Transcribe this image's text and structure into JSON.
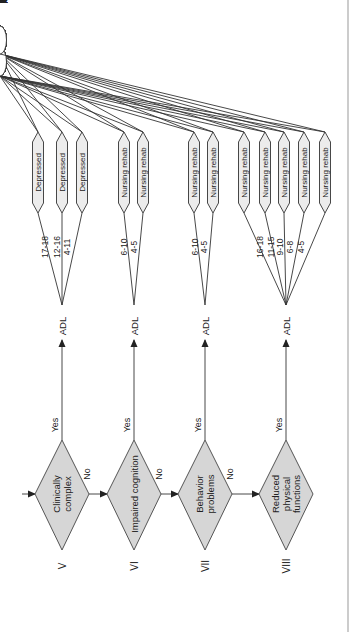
{
  "diagram": {
    "type": "decision-tree",
    "orientation": "rotated-90-ccw",
    "colors": {
      "diamond_fill": "#d6d6d6",
      "line": "#333333",
      "hex_fill": "#ececec",
      "background": "#ffffff"
    },
    "adl_label": "ADL",
    "yes_label": "Yes",
    "no_label": "No",
    "groups": [
      {
        "numeral": "V",
        "decision": [
          "Clinically",
          "complex"
        ],
        "has_no_exit": true,
        "branches": [
          {
            "range": "17-18",
            "node": "Depressed",
            "edges": [
              {
                "label": "Yes",
                "leaf": "CC2"
              },
              {
                "label": "No",
                "leaf": "CC1"
              }
            ]
          },
          {
            "range": "12-16",
            "node": "Depressed",
            "edges": [
              {
                "label": "Yes",
                "leaf": "CB2"
              },
              {
                "label": "No",
                "leaf": "CB1"
              }
            ]
          },
          {
            "range": "4-11",
            "node": "Depressed",
            "edges": [
              {
                "label": "Yes",
                "leaf": "CA2"
              },
              {
                "label": "No",
                "leaf": "CA1"
              }
            ]
          }
        ]
      },
      {
        "numeral": "VI",
        "decision": [
          "Impaired cognition"
        ],
        "has_no_exit": true,
        "branches": [
          {
            "range": "6-10",
            "node": "Nursing rehab",
            "edges": [
              {
                "label": "2+",
                "leaf": "IB2"
              },
              {
                "label": "0-1",
                "leaf": "IB1"
              }
            ]
          },
          {
            "range": "4-5",
            "node": "Nursing rehab",
            "edges": [
              {
                "label": "2+",
                "leaf": "IA2"
              },
              {
                "label": "0-1",
                "leaf": "IA1"
              }
            ]
          }
        ]
      },
      {
        "numeral": "VII",
        "decision": [
          "Behavior",
          "problems"
        ],
        "has_no_exit": true,
        "branches": [
          {
            "range": "6-10",
            "node": "Nursing rehab",
            "edges": [
              {
                "label": "2+",
                "leaf": "BB2"
              },
              {
                "label": "0-1",
                "leaf": "BB1"
              }
            ]
          },
          {
            "range": "4-5",
            "node": "Nursing rehab",
            "edges": [
              {
                "label": "2+",
                "leaf": "BA2"
              },
              {
                "label": "0-1",
                "leaf": "BA1"
              }
            ]
          }
        ]
      },
      {
        "numeral": "VIII",
        "decision": [
          "Reduced",
          "physical",
          "functions"
        ],
        "has_no_exit": false,
        "branches": [
          {
            "range": "16-18",
            "node": "Nursing rehab",
            "edges": [
              {
                "label": "2+",
                "leaf": "PE2"
              },
              {
                "label": "0-1",
                "leaf": "PE1"
              }
            ]
          },
          {
            "range": "11-15",
            "node": "Nursing rehab",
            "edges": [
              {
                "label": "2+",
                "leaf": "PD2"
              },
              {
                "label": "0-1",
                "leaf": "PD1"
              }
            ]
          },
          {
            "range": "9-10",
            "node": "Nursing rehab",
            "edges": [
              {
                "label": "2+",
                "leaf": "PC2"
              },
              {
                "label": "0-1",
                "leaf": "PC1"
              }
            ]
          },
          {
            "range": "6-8",
            "node": "Nursing rehab",
            "edges": [
              {
                "label": "2+",
                "leaf": "PB2"
              },
              {
                "label": "0-1",
                "leaf": "PB1"
              }
            ]
          },
          {
            "range": "4-5",
            "node": "Nursing rehab",
            "edges": [
              {
                "label": "2+",
                "leaf": "PA2"
              },
              {
                "label": "0-1",
                "leaf": "PA1"
              }
            ]
          }
        ]
      }
    ]
  }
}
